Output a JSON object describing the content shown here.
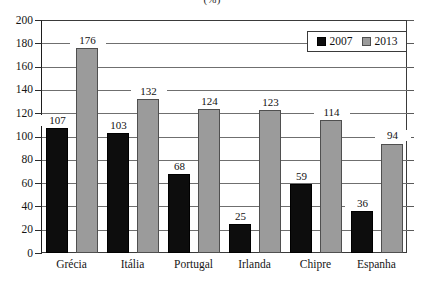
{
  "chart_data": {
    "type": "bar",
    "title": "",
    "subtitle": "(%)",
    "xlabel": "",
    "ylabel": "",
    "ylim": [
      0,
      200
    ],
    "ytick_step": 20,
    "yticks": [
      0,
      20,
      40,
      60,
      80,
      100,
      120,
      140,
      160,
      180,
      200
    ],
    "grid": true,
    "legend_position": "top-right",
    "categories": [
      "Grécia",
      "Itália",
      "Portugal",
      "Irlanda",
      "Chipre",
      "Espanha"
    ],
    "series": [
      {
        "name": "2007",
        "color": "#0d0d0d",
        "values": [
          107,
          103,
          68,
          25,
          59,
          36
        ]
      },
      {
        "name": "2013",
        "color": "#9b9b9b",
        "values": [
          176,
          132,
          124,
          123,
          114,
          94
        ]
      }
    ]
  },
  "legend": {
    "items": [
      {
        "label": "2007",
        "swatch": "black-square-icon"
      },
      {
        "label": "2013",
        "swatch": "gray-square-icon"
      }
    ]
  }
}
